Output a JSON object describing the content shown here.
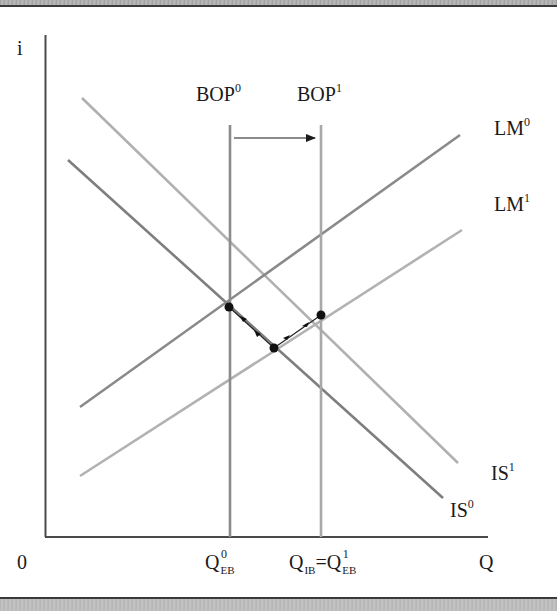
{
  "diagram": {
    "type": "IS-LM-BOP",
    "axes": {
      "y_label": "i",
      "x_label": "Q",
      "origin_label": "0"
    },
    "curves": {
      "bop0": {
        "label": "BOP",
        "sup": "0"
      },
      "bop1": {
        "label": "BOP",
        "sup": "1"
      },
      "lm0": {
        "label": "LM",
        "sup": "0"
      },
      "lm1": {
        "label": "LM",
        "sup": "1"
      },
      "is0": {
        "label": "IS",
        "sup": "0"
      },
      "is1": {
        "label": "IS",
        "sup": "1"
      }
    },
    "x_ticks": {
      "q_eb0": {
        "main": "Q",
        "sup": "0",
        "sub": "EB"
      },
      "q_ib": {
        "main": "Q",
        "sub": "IB",
        "eq": "="
      },
      "q_eb1": {
        "main": "Q",
        "sup": "1",
        "sub": "EB"
      }
    },
    "shift_arrow": {
      "from": "BOP0",
      "to": "BOP1",
      "direction": "right"
    },
    "equilibrium_points": [
      {
        "name": "initial",
        "x": 229,
        "y": 307
      },
      {
        "name": "intermediate",
        "x": 274,
        "y": 348
      },
      {
        "name": "final",
        "x": 321,
        "y": 315
      }
    ],
    "colors": {
      "axis": "#4a4a4a",
      "bop_line": "#8c8c8c",
      "lm0_line": "#8a8a8a",
      "lm1_line": "#b2b2b2",
      "is0_line": "#7e7e7e",
      "is1_line": "#b0b0b0",
      "point": "#111111",
      "text": "#1a1a1a"
    }
  }
}
